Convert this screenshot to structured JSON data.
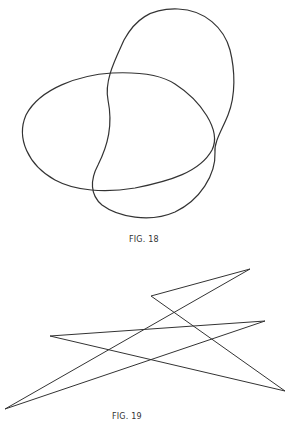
{
  "figures": [
    {
      "id": "fig18",
      "caption": "FIG. 18",
      "description": "Two overlapping closed curves: a horizontal egg-shaped loop and a vertical bean-shaped loop"
    },
    {
      "id": "fig19",
      "caption": "FIG. 19",
      "description": "Closed self-intersecting zigzag polygon",
      "vertices": [
        [
          250,
          269
        ],
        [
          151,
          296
        ],
        [
          285,
          391
        ],
        [
          50,
          336
        ],
        [
          265,
          321
        ],
        [
          5,
          409
        ]
      ]
    }
  ],
  "colors": {
    "stroke": "#333333",
    "background": "#ffffff"
  }
}
